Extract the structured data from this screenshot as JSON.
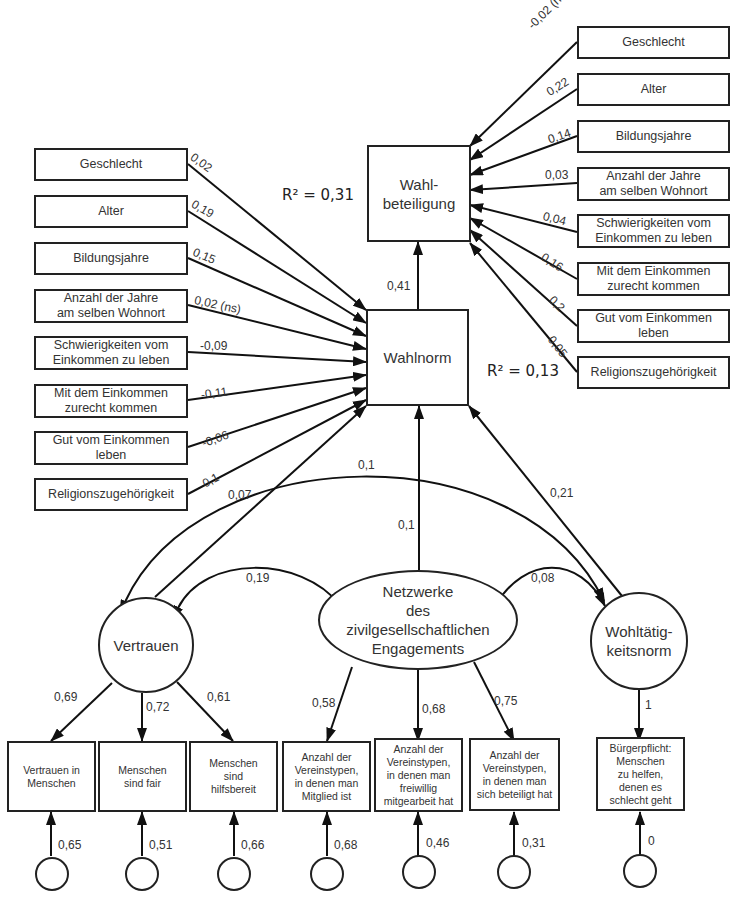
{
  "diagram": {
    "type": "structural-equation-model",
    "outcome": {
      "label": "Wahl-\nbeteiligung",
      "r_squared": "R² = 0,31"
    },
    "mediator": {
      "label": "Wahlnorm",
      "r_squared": "R² = 0,13"
    },
    "mediator_to_outcome": "0,41",
    "outcome_controls": [
      {
        "label": "Geschlecht",
        "coef": "-0,02 (ns)"
      },
      {
        "label": "Alter",
        "coef": "0,22"
      },
      {
        "label": "Bildungsjahre",
        "coef": "0,14"
      },
      {
        "label": "Anzahl der Jahre\nam selben Wohnort",
        "coef": "0,03"
      },
      {
        "label": "Schwierigkeiten vom\nEinkommen zu leben",
        "coef": "0,04"
      },
      {
        "label": "Mit dem Einkommen\nzurecht kommen",
        "coef": "0,16"
      },
      {
        "label": "Gut vom Einkommen\nleben",
        "coef": "0,2"
      },
      {
        "label": "Religionszugehörigkeit",
        "coef": "0,05"
      }
    ],
    "mediator_controls": [
      {
        "label": "Geschlecht",
        "coef": "0,02"
      },
      {
        "label": "Alter",
        "coef": "0,19"
      },
      {
        "label": "Bildungsjahre",
        "coef": "0,15"
      },
      {
        "label": "Anzahl der Jahre\nam selben Wohnort",
        "coef": "0,02 (ns)"
      },
      {
        "label": "Schwierigkeiten vom\nEinkommen zu leben",
        "coef": "-0,09"
      },
      {
        "label": "Mit dem Einkommen\nzurecht kommen",
        "coef": "-0,11"
      },
      {
        "label": "Gut vom Einkommen\nleben",
        "coef": "-0,06"
      },
      {
        "label": "Religionszugehörigkeit",
        "coef": "0,1"
      }
    ],
    "latents": [
      {
        "id": "vertrauen",
        "label": "Vertrauen",
        "to_mediator": "0,07"
      },
      {
        "id": "netzwerke",
        "label": "Netzwerke\ndes\nzivilgesellschaftlichen\nEngagements",
        "to_mediator": "0,1"
      },
      {
        "id": "wohltaetigkeit",
        "label": "Wohltätig-\nkeitsnorm",
        "to_mediator": "0,21"
      }
    ],
    "correlations": [
      {
        "between": [
          "Vertrauen",
          "Netzwerke"
        ],
        "value": "0,19"
      },
      {
        "between": [
          "Netzwerke",
          "Wohltätigkeitsnorm"
        ],
        "value": "0,08"
      },
      {
        "between": [
          "Vertrauen",
          "Wohltätigkeitsnorm"
        ],
        "value": "0,1"
      }
    ],
    "indicators": [
      {
        "label": "Vertrauen in\nMenschen",
        "loading": "0,69",
        "error": "0,65"
      },
      {
        "label": "Menschen\nsind fair",
        "loading": "0,72",
        "error": "0,51"
      },
      {
        "label": "Menschen\nsind\nhilfsbereit",
        "loading": "0,61",
        "error": "0,66"
      },
      {
        "label": "Anzahl der\nVereinstypen,\nin denen man\nMitglied ist",
        "loading": "0,58",
        "error": "0,68"
      },
      {
        "label": "Anzahl der\nVereinstypen,\nin denen man\nfreiwillig\nmitgearbeit hat",
        "loading": "0,68",
        "error": "0,46"
      },
      {
        "label": "Anzahl der\nVereinstypen,\nin denen man\nsich beteiligt hat",
        "loading": "0,75",
        "error": "0,31"
      },
      {
        "label": "Bürgerpflicht:\nMenschen\nzu helfen,\ndenen es\nschlecht geht",
        "loading": "1",
        "error": "0"
      }
    ]
  }
}
